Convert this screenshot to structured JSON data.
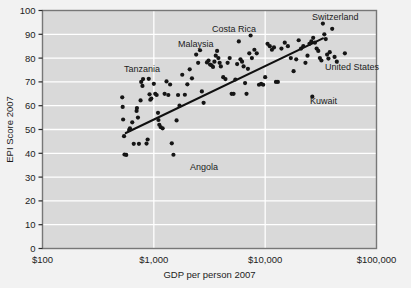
{
  "chart_data": {
    "type": "scatter",
    "title": "",
    "xlabel": "GDP per person 2007",
    "ylabel": "EPI Score 2007",
    "xscale": "log",
    "xlim": [
      100,
      100000
    ],
    "ylim": [
      0,
      100
    ],
    "grid": true,
    "legend": "none",
    "xticks": [
      100,
      1000,
      10000,
      100000
    ],
    "xticklabels": [
      "$100",
      "$1,000",
      "$10,000",
      "$100,000"
    ],
    "yticks": [
      0,
      10,
      20,
      30,
      40,
      50,
      60,
      70,
      80,
      90,
      100
    ],
    "yticklabels": [
      "0",
      "10",
      "20",
      "30",
      "40",
      "50",
      "60",
      "70",
      "80",
      "90",
      "100"
    ],
    "series": [
      {
        "name": "Countries",
        "marker": "circle",
        "color": "#151515",
        "points": [
          [
            520,
            63.5
          ],
          [
            525,
            59.5
          ],
          [
            530,
            54.2
          ],
          [
            540,
            47.2
          ],
          [
            545,
            39.5
          ],
          [
            565,
            39.3
          ],
          [
            600,
            49.8
          ],
          [
            610,
            50.5
          ],
          [
            640,
            53.0
          ],
          [
            660,
            44.0
          ],
          [
            700,
            57.8
          ],
          [
            705,
            59.0
          ],
          [
            720,
            55.0
          ],
          [
            735,
            44.0
          ],
          [
            760,
            62.2
          ],
          [
            770,
            70.0
          ],
          [
            790,
            68.3
          ],
          [
            800,
            71.2
          ],
          [
            860,
            44.1
          ],
          [
            880,
            45.8
          ],
          [
            900,
            71.3
          ],
          [
            915,
            64.8
          ],
          [
            930,
            62.5
          ],
          [
            950,
            63.0
          ],
          [
            1000,
            69.2
          ],
          [
            1030,
            65.0
          ],
          [
            1060,
            64.5
          ],
          [
            1090,
            57.0
          ],
          [
            1100,
            54.0
          ],
          [
            1120,
            52.0
          ],
          [
            1150,
            51.0
          ],
          [
            1200,
            50.5
          ],
          [
            1250,
            65.0
          ],
          [
            1300,
            70.2
          ],
          [
            1350,
            64.5
          ],
          [
            1400,
            68.9
          ],
          [
            1450,
            44.2
          ],
          [
            1500,
            39.4
          ],
          [
            1600,
            53.8
          ],
          [
            1650,
            64.5
          ],
          [
            1700,
            60.0
          ],
          [
            1800,
            73.0
          ],
          [
            1900,
            64.6
          ],
          [
            2000,
            69.0
          ],
          [
            2100,
            75.3
          ],
          [
            2200,
            71.5
          ],
          [
            2400,
            81.5
          ],
          [
            2500,
            78.0
          ],
          [
            2600,
            83.3
          ],
          [
            2700,
            66.0
          ],
          [
            2800,
            61.2
          ],
          [
            3000,
            78.2
          ],
          [
            3100,
            79.0
          ],
          [
            3200,
            77.3
          ],
          [
            3300,
            77.0
          ],
          [
            3400,
            76.3
          ],
          [
            3500,
            78.5
          ],
          [
            3600,
            81.0
          ],
          [
            3700,
            83.0
          ],
          [
            3800,
            80.0
          ],
          [
            3900,
            78.0
          ],
          [
            4000,
            76.5
          ],
          [
            4200,
            72.0
          ],
          [
            4400,
            71.2
          ],
          [
            4600,
            78.0
          ],
          [
            4800,
            80.0
          ],
          [
            5000,
            65.0
          ],
          [
            5200,
            65.0
          ],
          [
            5400,
            71.0
          ],
          [
            5600,
            77.5
          ],
          [
            5800,
            87.0
          ],
          [
            6000,
            79.5
          ],
          [
            6200,
            78.5
          ],
          [
            6400,
            76.5
          ],
          [
            6600,
            69.5
          ],
          [
            6800,
            65.0
          ],
          [
            7000,
            75.5
          ],
          [
            7200,
            82.0
          ],
          [
            7400,
            89.5
          ],
          [
            7600,
            80.0
          ],
          [
            8000,
            83.5
          ],
          [
            8400,
            82.0
          ],
          [
            8800,
            68.8
          ],
          [
            9200,
            69.2
          ],
          [
            9600,
            68.8
          ],
          [
            10000,
            72.0
          ],
          [
            10500,
            86.0
          ],
          [
            11000,
            85.0
          ],
          [
            11500,
            83.5
          ],
          [
            12000,
            84.5
          ],
          [
            12500,
            70.0
          ],
          [
            13000,
            70.0
          ],
          [
            14000,
            84.0
          ],
          [
            15000,
            86.5
          ],
          [
            16000,
            85.0
          ],
          [
            17000,
            80.0
          ],
          [
            18000,
            74.5
          ],
          [
            19000,
            79.5
          ],
          [
            20000,
            87.5
          ],
          [
            21000,
            84.0
          ],
          [
            22000,
            85.0
          ],
          [
            23000,
            78.0
          ],
          [
            24000,
            81.0
          ],
          [
            25000,
            86.0
          ],
          [
            26000,
            87.0
          ],
          [
            27000,
            88.5
          ],
          [
            28000,
            86.5
          ],
          [
            29000,
            84.0
          ],
          [
            30000,
            83.0
          ],
          [
            31000,
            80.0
          ],
          [
            32000,
            79.0
          ],
          [
            33000,
            94.5
          ],
          [
            34000,
            90.0
          ],
          [
            35000,
            88.0
          ],
          [
            36000,
            81.5
          ],
          [
            37000,
            79.8
          ],
          [
            38000,
            82.5
          ],
          [
            40000,
            92.3
          ],
          [
            42000,
            80.5
          ],
          [
            44000,
            78.5
          ],
          [
            26500,
            63.8
          ],
          [
            52000,
            82.0
          ]
        ]
      }
    ],
    "trendline": {
      "x0": 560,
      "y0": 48.5,
      "x1": 33000,
      "y1": 88.3,
      "color": "#101010"
    },
    "annotations": [
      {
        "label": "Tanzania",
        "x_px": 124,
        "y_px": 72,
        "anchor": "start"
      },
      {
        "label": "Malaysia",
        "x_px": 178,
        "y_px": 47,
        "anchor": "start"
      },
      {
        "label": "Costa Rica",
        "x_px": 212,
        "y_px": 32,
        "anchor": "start"
      },
      {
        "label": "Switzerland",
        "x_px": 312,
        "y_px": 20,
        "anchor": "start"
      },
      {
        "label": "United States",
        "x_px": 325,
        "y_px": 70,
        "anchor": "start"
      },
      {
        "label": "Kuwait",
        "x_px": 310,
        "y_px": 104,
        "anchor": "start"
      },
      {
        "label": "Angola",
        "x_px": 190,
        "y_px": 170,
        "anchor": "start"
      }
    ],
    "style": {
      "plot_background": "#d9d9d9",
      "page_background": "#f2f2f2",
      "gridline_color": "#ffffff",
      "border_color": "#777777",
      "marker_color": "#151515",
      "text_color": "#1c1c1c"
    }
  }
}
